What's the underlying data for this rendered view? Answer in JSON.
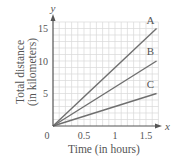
{
  "chart_data": {
    "type": "line",
    "title": "",
    "xlabel": "Time (in hours)",
    "ylabel": "Total distance (in kilometers)",
    "ylabel_lines": [
      "Total distance",
      "(in kilometers)"
    ],
    "x_axis_letter": "x",
    "y_axis_letter": "y",
    "xlim": [
      0,
      1.7
    ],
    "ylim": [
      0,
      16
    ],
    "x_ticks": [
      0,
      0.5,
      1,
      1.5
    ],
    "x_tick_labels": [
      "0",
      "0.5",
      "1",
      "1.5"
    ],
    "y_ticks": [
      5,
      10,
      15
    ],
    "y_tick_labels": [
      "5",
      "10",
      "15"
    ],
    "origin_label": "0",
    "grid": true,
    "grid_x_step": 0.1,
    "grid_y_step": 1,
    "legend": "inline labels at line ends",
    "series": [
      {
        "name": "A",
        "slope_km_per_h": 9,
        "x": [
          0,
          1.67
        ],
        "y": [
          0,
          15
        ]
      },
      {
        "name": "B",
        "slope_km_per_h": 6,
        "x": [
          0,
          1.67
        ],
        "y": [
          0,
          10
        ]
      },
      {
        "name": "C",
        "slope_km_per_h": 3,
        "x": [
          0,
          1.67
        ],
        "y": [
          0,
          5
        ]
      }
    ]
  },
  "colors": {
    "grid": "#d9d9d9",
    "axis": "#555555",
    "series_line": "#6f6f6f",
    "text": "#555555"
  }
}
